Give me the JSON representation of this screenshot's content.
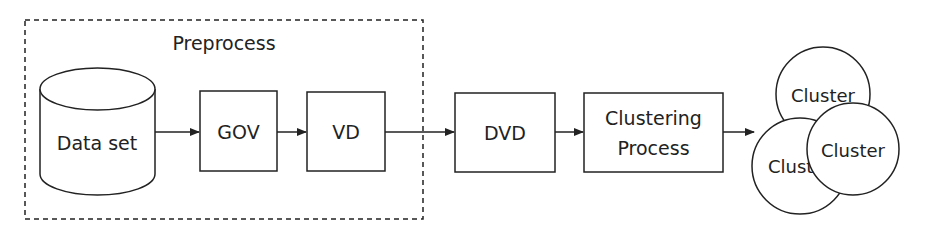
{
  "diagram": {
    "group_label": "Preprocess",
    "nodes": {
      "dataset": "Data set",
      "gov": "GOV",
      "vd": "VD",
      "dvd": "DVD",
      "clustering_line1": "Clustering",
      "clustering_line2": "Process",
      "cluster_top": "Cluster",
      "cluster_left": "Clust",
      "cluster_right": "Cluster"
    },
    "colors": {
      "stroke": "#222222",
      "background": "#ffffff"
    }
  }
}
